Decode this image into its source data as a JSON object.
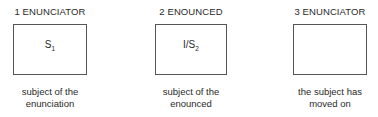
{
  "diagram": {
    "columns": [
      {
        "heading": "1 ENUNCIATOR",
        "box_symbol": "S",
        "box_subscript": "1",
        "caption_line1": "subject of the",
        "caption_line2": "enunciation"
      },
      {
        "heading": "2 ENOUNCED",
        "box_symbol": "I/S",
        "box_subscript": "2",
        "caption_line1": "subject of the",
        "caption_line2": "enounced"
      },
      {
        "heading": "3 ENUNCIATOR",
        "box_symbol": "",
        "box_subscript": "",
        "caption_line1": "the subject has",
        "caption_line2": "moved on"
      }
    ]
  }
}
